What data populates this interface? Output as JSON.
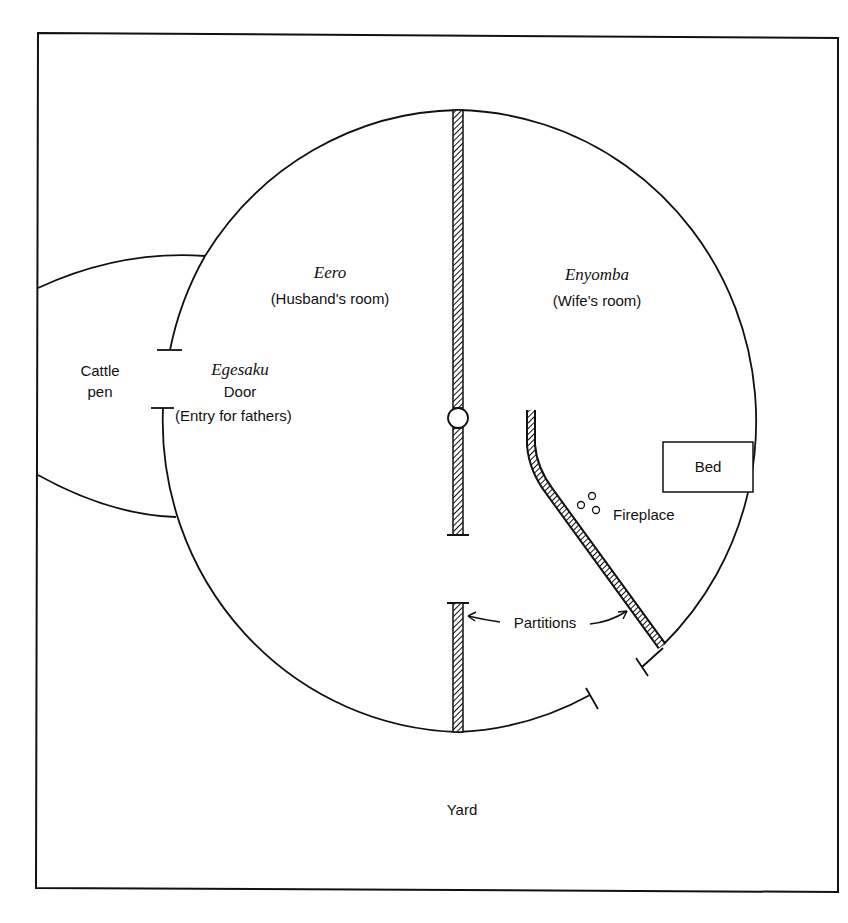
{
  "diagram": {
    "type": "floor-plan",
    "rooms": {
      "husband": {
        "name": "Eero",
        "description": "(Husband's room)"
      },
      "wife": {
        "name": "Enyomba",
        "description": "(Wife's room)"
      }
    },
    "door": {
      "name": "Egesaku",
      "label": "Door",
      "description": "(Entry for fathers)"
    },
    "cattle_pen": {
      "line1": "Cattle",
      "line2": "pen"
    },
    "bed": {
      "label": "Bed"
    },
    "fireplace": {
      "label": "Fireplace"
    },
    "partitions": {
      "label": "Partitions"
    },
    "yard": {
      "label": "Yard"
    },
    "colors": {
      "line": "#111111",
      "background": "#ffffff"
    }
  }
}
